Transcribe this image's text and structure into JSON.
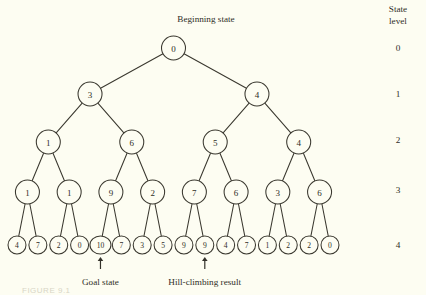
{
  "figure": {
    "background_color": "#fdfdf2",
    "ink_color": "#33312a",
    "beginning_state_label": "Beginning state",
    "goal_state_label": "Goal state",
    "hill_climbing_label": "Hill-climbing result",
    "caption": "FIGURE 9.1"
  },
  "margin": {
    "header_line1": "State",
    "header_line2": "level",
    "levels": [
      "0",
      "1",
      "2",
      "3",
      "4"
    ]
  },
  "chart_data": {
    "type": "diagram",
    "title": "Beginning state",
    "subtype": "binary-tree",
    "levels": 5,
    "nodes_by_level": {
      "0": [
        "0"
      ],
      "1": [
        "3",
        "4"
      ],
      "2": [
        "1",
        "6",
        "5",
        "4"
      ],
      "3": [
        "1",
        "1",
        "9",
        "2",
        "7",
        "6",
        "3",
        "6"
      ],
      "4": [
        "4",
        "7",
        "2",
        "0",
        "10",
        "7",
        "3",
        "5",
        "9",
        "9",
        "4",
        "7",
        "1",
        "2",
        "2",
        "0"
      ]
    },
    "annotations": [
      {
        "label": "Goal state",
        "points_to_level": 4,
        "points_to_index": 4,
        "value": "10"
      },
      {
        "label": "Hill-climbing result",
        "points_to_level": 4,
        "points_to_index": 9,
        "value": "9"
      }
    ],
    "level_labels": [
      "0",
      "1",
      "2",
      "3",
      "4"
    ],
    "axis_label": "State level"
  }
}
